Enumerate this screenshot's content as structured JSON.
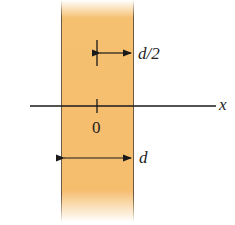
{
  "figure": {
    "labels": {
      "half_width": "d/2",
      "axis": "x",
      "origin": "0",
      "width": "d"
    },
    "colors": {
      "slab": "#f5bd6e",
      "line": "#1a1a1a"
    }
  }
}
